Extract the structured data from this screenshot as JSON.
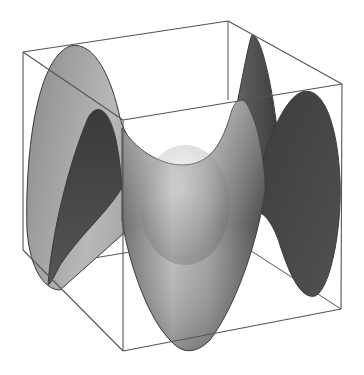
{
  "figure": {
    "background": "#ffffff",
    "colors": {
      "box_edge": "#555555",
      "surface_outline": "#3a3a3a",
      "surface_light": "#d8d8d8",
      "surface_mid": "#8c8c8c",
      "surface_dark": "#3c3c3c"
    }
  }
}
